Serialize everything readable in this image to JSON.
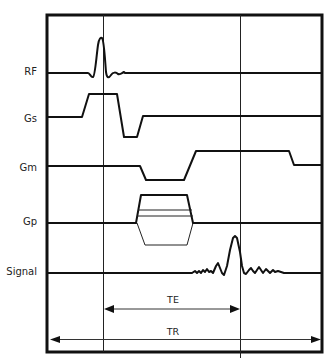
{
  "diagram": {
    "title": "",
    "type": "MRI spin-echo pulse sequence timing diagram",
    "channels": [
      {
        "id": "rf",
        "label": "RF"
      },
      {
        "id": "gs",
        "label": "Gs"
      },
      {
        "id": "gm",
        "label": "Gm"
      },
      {
        "id": "gp",
        "label": "Gp"
      },
      {
        "id": "signal",
        "label": "Signal"
      }
    ],
    "intervals": {
      "te": {
        "label": "TE"
      },
      "tr": {
        "label": "TR"
      }
    },
    "colors": {
      "line": "#111111",
      "background": "#ffffff"
    }
  }
}
